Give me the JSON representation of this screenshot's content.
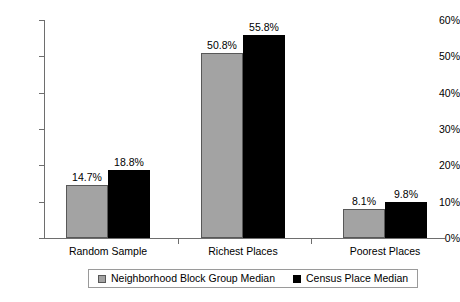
{
  "chart_data": {
    "type": "bar",
    "title": "",
    "subtitle": "",
    "xlabel": "",
    "ylabel": "",
    "categories": [
      "Random Sample",
      "Richest Places",
      "Poorest Places"
    ],
    "series": [
      {
        "name": "Neighborhood Block Group Median",
        "color": "#a3a3a3",
        "values": [
          14.7,
          50.8,
          8.1
        ],
        "labels": [
          "14.7%",
          "50.8%",
          "8.1%"
        ]
      },
      {
        "name": "Census Place Median",
        "color": "#000000",
        "values": [
          18.8,
          55.8,
          9.8
        ],
        "labels": [
          "18.8%",
          "55.8%",
          "9.8%"
        ]
      }
    ],
    "ylim": [
      0,
      60
    ],
    "ytick_values": [
      0,
      10,
      20,
      30,
      40,
      50,
      60
    ],
    "ytick_labels": [
      "0%",
      "10%",
      "20%",
      "30%",
      "40%",
      "50%",
      "60%"
    ],
    "grid": false,
    "legend_position": "bottom",
    "value_labels_shown": true,
    "axis_color": "#6e6e6e",
    "background_color": "#ffffff"
  },
  "legend": {
    "entries": [
      {
        "label": "Neighborhood Block Group Median",
        "swatch": "legend-swatch-gray"
      },
      {
        "label": "Census Place Median",
        "swatch": "legend-swatch-black"
      }
    ]
  }
}
